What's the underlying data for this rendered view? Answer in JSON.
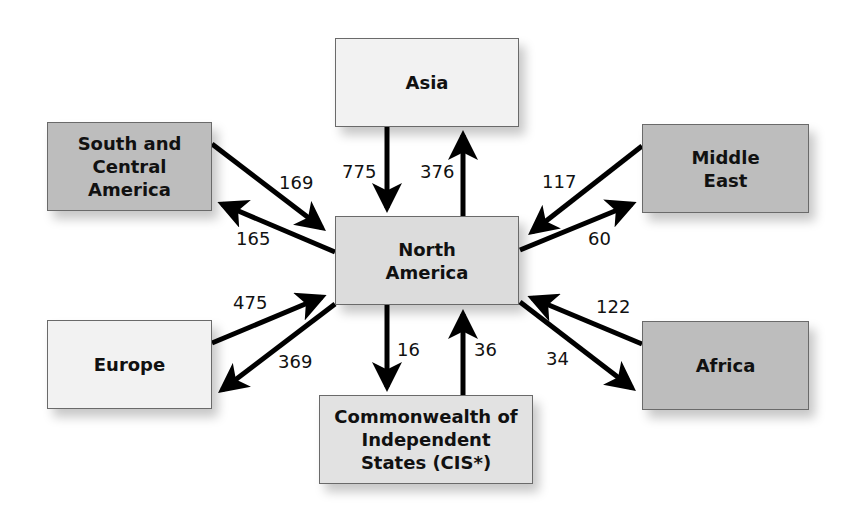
{
  "diagram": {
    "type": "flow",
    "center": "North America",
    "regions": {
      "asia": {
        "label": "Asia",
        "shade": "#f2f2f2"
      },
      "south_central_america": {
        "label": "South and Central America",
        "shade": "#bdbdbd"
      },
      "middle_east": {
        "label": "Middle East",
        "shade": "#bdbdbd"
      },
      "north_america": {
        "label": "North America",
        "shade": "#dcdcdc"
      },
      "europe": {
        "label": "Europe",
        "shade": "#f2f2f2"
      },
      "africa": {
        "label": "Africa",
        "shade": "#bdbdbd"
      },
      "cis": {
        "label": "Commonwealth of Independent States (CIS*)",
        "shade": "#dcdcdc"
      }
    },
    "flows": [
      {
        "from": "Asia",
        "to": "North America",
        "value": "775"
      },
      {
        "from": "North America",
        "to": "Asia",
        "value": "376"
      },
      {
        "from": "South and Central America",
        "to": "North America",
        "value": "169"
      },
      {
        "from": "North America",
        "to": "South and Central America",
        "value": "165"
      },
      {
        "from": "Middle East",
        "to": "North America",
        "value": "117"
      },
      {
        "from": "North America",
        "to": "Middle East",
        "value": "60"
      },
      {
        "from": "Europe",
        "to": "North America",
        "value": "475"
      },
      {
        "from": "North America",
        "to": "Europe",
        "value": "369"
      },
      {
        "from": "North America",
        "to": "Commonwealth of Independent States (CIS*)",
        "value": "16"
      },
      {
        "from": "Commonwealth of Independent States (CIS*)",
        "to": "North America",
        "value": "36"
      },
      {
        "from": "Africa",
        "to": "North America",
        "value": "122"
      },
      {
        "from": "North America",
        "to": "Africa",
        "value": "34"
      }
    ]
  }
}
